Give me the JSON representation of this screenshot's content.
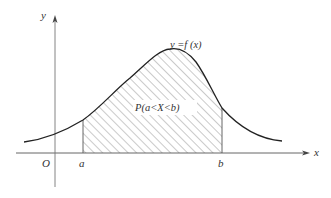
{
  "diagram": {
    "labels": {
      "y_axis": "y",
      "x_axis": "x",
      "origin": "O",
      "a": "a",
      "b": "b",
      "curve": "y =f (x)",
      "area": "P(a<X<b)"
    },
    "colors": {
      "curve": "#222222",
      "axis": "#555555",
      "hatch": "#777777",
      "text": "#333333",
      "background": "#ffffff"
    },
    "geometry": {
      "x_axis_y": 153,
      "x_axis_start": 16,
      "x_axis_end": 310,
      "y_axis_x": 55,
      "y_axis_top": 16,
      "y_axis_bottom": 187,
      "a_x": 83,
      "b_x": 222,
      "peak": [
        178,
        49
      ],
      "curve_left_end": [
        24,
        142
      ],
      "curve_right_end": [
        282,
        141
      ]
    }
  }
}
